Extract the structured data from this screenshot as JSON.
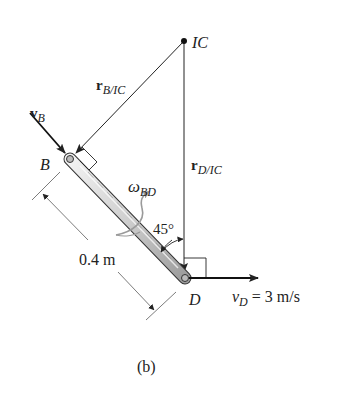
{
  "figure": {
    "caption": "(b)",
    "colors": {
      "line": "#222222",
      "rod_fill": "#d8d8d8",
      "rod_edge": "#333333",
      "omega_arrow": "#9a9a9a",
      "background": "#ffffff"
    }
  },
  "labels": {
    "ic": "IC",
    "r_b_ic_main": "r",
    "r_b_ic_sub": "B/IC",
    "r_d_ic_main": "r",
    "r_d_ic_sub": "D/IC",
    "v_b_main": "v",
    "v_b_sub": "B",
    "point_b": "B",
    "point_d": "D",
    "omega_main": "ω",
    "omega_sub": "BD",
    "angle": "45°",
    "length": "0.4 m",
    "v_d_main": "v",
    "v_d_sub": "D",
    "v_d_value": " = 3 m/s"
  },
  "geometry": {
    "ic_point": [
      184,
      41
    ],
    "b_point": [
      70,
      159
    ],
    "d_point": [
      185,
      278
    ],
    "rod_length_m": 0.4,
    "angle_deg": 45,
    "v_d_mps": 3
  }
}
